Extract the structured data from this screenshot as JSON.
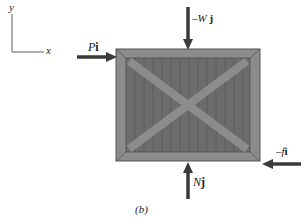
{
  "axes": {
    "y_label": "y",
    "x_label": "x"
  },
  "forces": {
    "applied": {
      "symbol": "P",
      "unit_vector": "i"
    },
    "weight": {
      "prefix": "–",
      "symbol": "W",
      "unit_vector": "j"
    },
    "normal": {
      "symbol": "N",
      "unit_vector": "j"
    },
    "friction": {
      "prefix": "–",
      "symbol": "f",
      "unit_vector": "i"
    }
  },
  "caption": "(b)",
  "colors": {
    "crate_frame": "#8a8a8a",
    "crate_body": "#6e6e6e",
    "arrow": "#3a3a3a",
    "axis": "#777777"
  }
}
